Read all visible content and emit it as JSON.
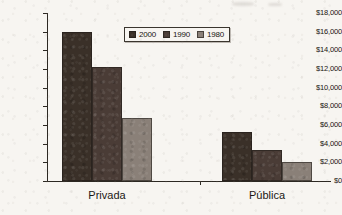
{
  "chart_data": {
    "type": "bar",
    "title": "",
    "subtitle": "",
    "xlabel": "",
    "ylabel": "",
    "categories": [
      "Privada",
      "Pública"
    ],
    "series": [
      {
        "name": "2000",
        "color": "#3a3028",
        "values": [
          16000,
          5200
        ]
      },
      {
        "name": "1990",
        "color": "#4a3c36",
        "values": [
          12200,
          3300
        ]
      },
      {
        "name": "1980",
        "color": "#8a8078",
        "values": [
          6800,
          2000
        ]
      }
    ],
    "ylim": [
      0,
      18000
    ],
    "ytick_step": 2000,
    "ytick_labels": [
      "$0",
      "$2,000",
      "$4,000",
      "$6,000",
      "$8,000",
      "$10,000",
      "$12,000",
      "$14,000",
      "$16,000",
      "$18,000"
    ],
    "ytick_values": [
      0,
      2000,
      4000,
      6000,
      8000,
      10000,
      12000,
      14000,
      16000,
      18000
    ],
    "grid": false,
    "legend_position": "top-center",
    "legend_entries": [
      "2000",
      "1990",
      "1980"
    ]
  },
  "figure": {
    "background_color": "#f7f5f1",
    "axis_color": "#2c2822",
    "text_color": "#17140f"
  }
}
